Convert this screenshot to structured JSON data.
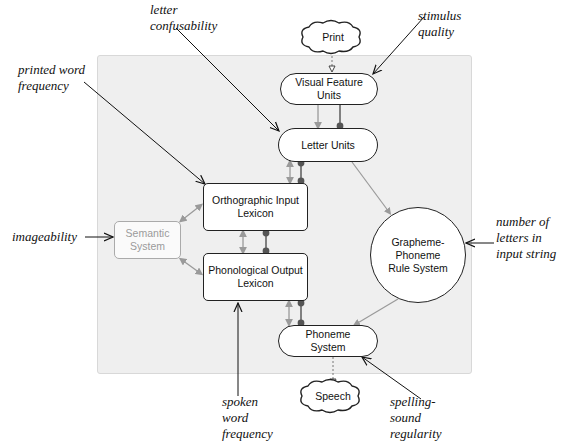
{
  "diagram": {
    "type": "dual-route cascaded reading model",
    "input": {
      "label": "Print"
    },
    "output": {
      "label": "Speech"
    },
    "nodes": [
      {
        "id": "visual_feature_units",
        "label": "Visual Feature Units",
        "line1": "Visual Feature",
        "line2": "Units",
        "shape": "pill"
      },
      {
        "id": "letter_units",
        "label": "Letter Units",
        "shape": "pill"
      },
      {
        "id": "orthographic_input_lexicon",
        "label": "Orthographic Input Lexicon",
        "line1": "Orthographic Input",
        "line2": "Lexicon",
        "shape": "rect"
      },
      {
        "id": "phonological_output_lexicon",
        "label": "Phonological Output Lexicon",
        "line1": "Phonological Output",
        "line2": "Lexicon",
        "shape": "rect"
      },
      {
        "id": "semantic_system",
        "label": "Semantic System",
        "line1": "Semantic",
        "line2": "System",
        "shape": "rect",
        "faded": true
      },
      {
        "id": "gpc_rule_system",
        "label": "Grapheme-Phoneme Rule System",
        "line1": "Grapheme-",
        "line2": "Phoneme",
        "line3": "Rule System",
        "shape": "circle"
      },
      {
        "id": "phoneme_system",
        "label": "Phoneme System",
        "line1": "Phoneme",
        "line2": "System",
        "shape": "pill"
      }
    ],
    "annotations": [
      {
        "id": "letter_confusability",
        "line1": "letter",
        "line2": "confusability",
        "target": "letter_units"
      },
      {
        "id": "stimulus_quality",
        "line1": "stimulus",
        "line2": "quality",
        "target": "visual_feature_units"
      },
      {
        "id": "printed_word_frequency",
        "line1": "printed word",
        "line2": "frequency",
        "target": "orthographic_input_lexicon"
      },
      {
        "id": "imageability",
        "line1": "imageability",
        "target": "semantic_system"
      },
      {
        "id": "number_of_letters",
        "line1": "number of",
        "line2": "letters in",
        "line3": "input string",
        "target": "gpc_rule_system"
      },
      {
        "id": "spoken_word_frequency",
        "line1": "spoken",
        "line2": "word",
        "line3": "frequency",
        "target": "phonological_output_lexicon"
      },
      {
        "id": "spelling_sound_regularity",
        "line1": "spelling-",
        "line2": "sound",
        "line3": "regularity",
        "target": "phoneme_system"
      }
    ],
    "colors": {
      "panel": "#efefef",
      "excitatory": "#9a9a9a",
      "inhibitory": "#444444",
      "annotation_arrow": "#111111"
    }
  }
}
